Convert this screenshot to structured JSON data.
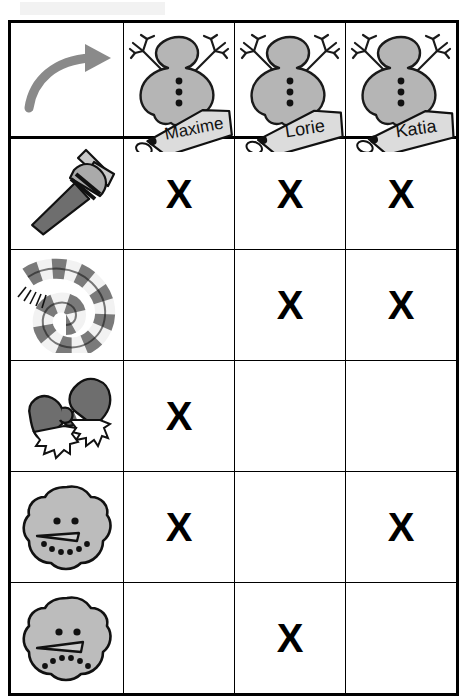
{
  "page": {
    "title_bar_faded": true,
    "doc_type": "worksheet-table",
    "colors": {
      "ink": "#000000",
      "snow_gray": "#b3b3b3",
      "snow_gray_dark": "#8c8c8c",
      "arrow_gray": "#8a8a8a",
      "tag_gray": "#d8d8d8",
      "faded_header": "#f2f2f2",
      "page_bg": "#ffffff"
    }
  },
  "table": {
    "corner_cell": {
      "icon": "curved-arrow-right-icon",
      "label": ""
    },
    "columns": [
      {
        "id": "maxime",
        "name": "Maxime",
        "icon": "snowman-icon",
        "tag_icon": "name-tag-icon"
      },
      {
        "id": "lorie",
        "name": "Lorie",
        "icon": "snowman-icon",
        "tag_icon": "name-tag-icon"
      },
      {
        "id": "katia",
        "name": "Katia",
        "icon": "snowman-icon",
        "tag_icon": "name-tag-icon"
      }
    ],
    "rows": [
      {
        "id": "broom",
        "icon": "broom-icon",
        "label": "",
        "marks": [
          "X",
          "X",
          "X"
        ]
      },
      {
        "id": "scarf",
        "icon": "checkered-scarf-icon",
        "label": "",
        "marks": [
          "",
          "X",
          "X"
        ]
      },
      {
        "id": "mittens",
        "icon": "mittens-icon",
        "label": "",
        "marks": [
          "X",
          "",
          ""
        ]
      },
      {
        "id": "happy-face",
        "icon": "snowman-head-smiling-icon",
        "label": "",
        "marks": [
          "X",
          "",
          "X"
        ]
      },
      {
        "id": "frowning-face",
        "icon": "snowman-head-frowning-icon",
        "label": "",
        "marks": [
          "",
          "X",
          ""
        ]
      }
    ],
    "mark_symbol": "X"
  }
}
